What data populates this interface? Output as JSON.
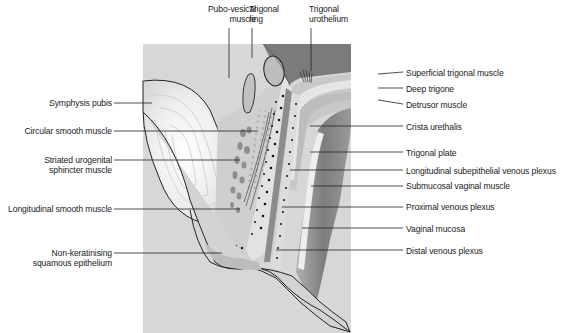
{
  "figure": {
    "type": "anatomical cross-section diagram",
    "colors": {
      "background": "#ffffff",
      "stroma": "#d6d6d6",
      "bladder_dark": "#7a7a7a",
      "urothelium": "#e8e8e8",
      "vagina_dark": "#8c8c8c",
      "outline": "#222222"
    }
  },
  "labels": {
    "top": [
      {
        "id": "pubo-vesical-muscle",
        "lines": [
          "Pubo-vesical",
          "muscle"
        ]
      },
      {
        "id": "trigonal-ring",
        "lines": [
          "Trigonal",
          "ring"
        ]
      },
      {
        "id": "trigonal-urothelium",
        "lines": [
          "Trigonal",
          "urothelium"
        ]
      }
    ],
    "left": [
      {
        "id": "symphysis-pubis",
        "lines": [
          "Symphysis pubis"
        ]
      },
      {
        "id": "circular-smooth-muscle",
        "lines": [
          "Circular smooth muscle"
        ]
      },
      {
        "id": "striated-urogenital-sphincter-muscle",
        "lines": [
          "Striated urogenital",
          "sphincter muscle"
        ]
      },
      {
        "id": "longitudinal-smooth-muscle",
        "lines": [
          "Longitudinal smooth muscle"
        ]
      },
      {
        "id": "non-keratinising-squamous-epithelium",
        "lines": [
          "Non-keratinising",
          "squamous epithelium"
        ]
      }
    ],
    "right": [
      {
        "id": "superficial-trigonal-muscle",
        "lines": [
          "Superficial trigonal muscle"
        ]
      },
      {
        "id": "deep-trigone",
        "lines": [
          "Deep trigone"
        ]
      },
      {
        "id": "detrusor-muscle",
        "lines": [
          "Detrusor muscle"
        ]
      },
      {
        "id": "crista-urethalis",
        "lines": [
          "Crista urethalis"
        ]
      },
      {
        "id": "trigonal-plate",
        "lines": [
          "Trigonal plate"
        ]
      },
      {
        "id": "longitudinal-subepithelial-venous-plexus",
        "lines": [
          "Longitudinal subepithelial venous plexus"
        ]
      },
      {
        "id": "submucosal-vaginal-muscle",
        "lines": [
          "Submucosal vaginal muscle"
        ]
      },
      {
        "id": "proximal-venous-plexus",
        "lines": [
          "Proximal venous plexus"
        ]
      },
      {
        "id": "vaginal-mucosa",
        "lines": [
          "Vaginal mucosa"
        ]
      },
      {
        "id": "distal-venous-plexus",
        "lines": [
          "Distal venous plexus"
        ]
      }
    ]
  }
}
